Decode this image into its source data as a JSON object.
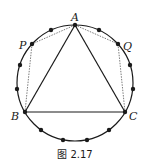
{
  "figure": {
    "caption": "图 2.17",
    "circle": {
      "cx": 75,
      "cy": 83,
      "r": 58
    },
    "num_points_on_circle": 15,
    "labels": {
      "A": "A",
      "B": "B",
      "C": "C",
      "P": "P",
      "Q": "Q"
    },
    "points": {
      "A": [
        75,
        25
      ],
      "P": [
        32,
        44
      ],
      "B": [
        25,
        112
      ],
      "C": [
        125,
        112
      ],
      "Q": [
        118,
        44
      ]
    },
    "unlabeled_dots": [
      [
        51,
        30
      ],
      [
        20,
        65
      ],
      [
        17,
        89
      ],
      [
        41,
        130
      ],
      [
        63,
        140
      ],
      [
        87,
        140
      ],
      [
        109,
        130
      ],
      [
        133,
        89
      ],
      [
        130,
        65
      ],
      [
        99,
        30
      ]
    ],
    "solid_segments": [
      "AB",
      "BC",
      "CA"
    ],
    "dashed_segments": [
      "AP",
      "PB",
      "AQ",
      "QC"
    ],
    "colors": {
      "ink": "#1a1a1a",
      "background": "#ffffff"
    }
  }
}
